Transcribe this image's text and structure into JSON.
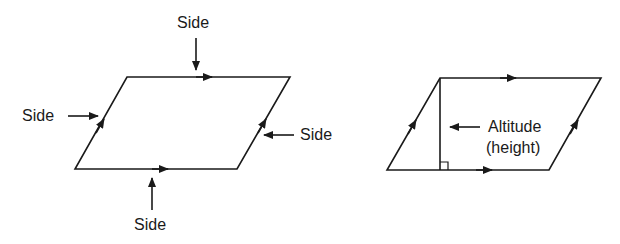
{
  "figure1": {
    "title": "Parallelogram sides",
    "labels": {
      "top": "Side",
      "left": "Side",
      "right": "Side",
      "bottom": "Side"
    }
  },
  "figure2": {
    "title": "Parallelogram altitude",
    "labels": {
      "altitude": "Altitude",
      "height": "(height)"
    }
  },
  "colors": {
    "stroke": "#1a1a1a",
    "background": "#ffffff"
  }
}
